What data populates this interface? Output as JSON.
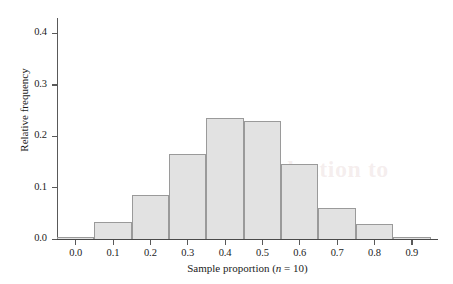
{
  "chart_data": {
    "type": "bar",
    "title": "",
    "subtitle": "",
    "xlabel": "Sample proportion (n = 10)",
    "xlabel_parts": {
      "before": "Sample proportion (",
      "italic": "n",
      "after": " = 10)"
    },
    "ylabel": "Relative frequency",
    "categories": [
      "0.0",
      "0.1",
      "0.2",
      "0.3",
      "0.4",
      "0.5",
      "0.6",
      "0.7",
      "0.8",
      "0.9"
    ],
    "x": [
      0.0,
      0.1,
      0.2,
      0.3,
      0.4,
      0.5,
      0.6,
      0.7,
      0.8,
      0.9
    ],
    "values": [
      0.002,
      0.033,
      0.086,
      0.165,
      0.236,
      0.23,
      0.146,
      0.061,
      0.029,
      0.004
    ],
    "bin_width": 0.1,
    "bin_edges": [
      -0.05,
      0.05,
      0.15,
      0.25,
      0.35,
      0.45,
      0.55,
      0.65,
      0.75,
      0.85,
      0.95
    ],
    "xlim": [
      -0.05,
      0.97
    ],
    "ylim": [
      0.0,
      0.43
    ],
    "xticks": [
      0.0,
      0.1,
      0.2,
      0.3,
      0.4,
      0.5,
      0.6,
      0.7,
      0.8,
      0.9
    ],
    "xtick_labels": [
      "0.0",
      "0.1",
      "0.2",
      "0.3",
      "0.4",
      "0.5",
      "0.6",
      "0.7",
      "0.8",
      "0.9"
    ],
    "yticks": [
      0.0,
      0.1,
      0.2,
      0.3,
      0.4
    ],
    "ytick_labels": [
      "0.0",
      "0.1",
      "0.2",
      "0.3",
      "0.4"
    ],
    "grid": false,
    "legend": null,
    "legend_position": "none",
    "annotations": [],
    "colors": {
      "bar_fill": "#e2e2e2",
      "bar_border": "#9a9a9a",
      "axis": "#595959",
      "text": "#1c1c1c",
      "background": "#ffffff"
    }
  },
  "watermark": {
    "text": "Introduction to"
  }
}
